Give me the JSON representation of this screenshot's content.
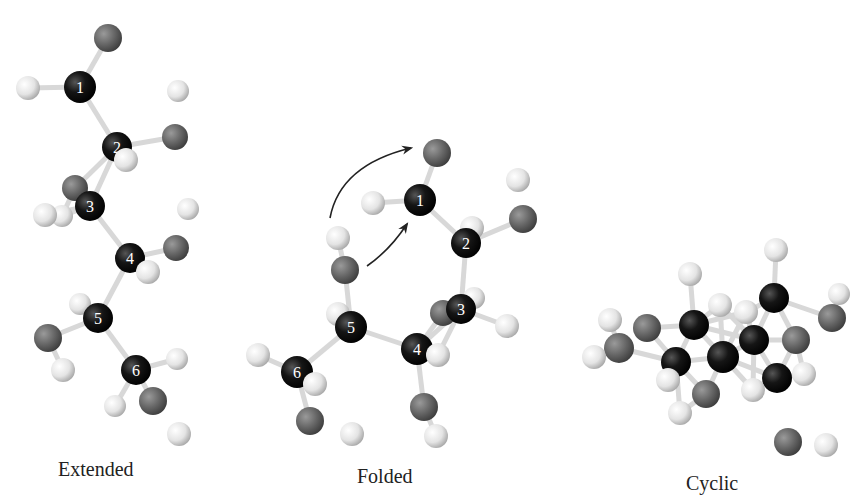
{
  "figure": {
    "panels": [
      {
        "id": "extended",
        "caption": "Extended",
        "carbon_labels": [
          "1",
          "2",
          "3",
          "4",
          "5",
          "6"
        ],
        "atoms": [
          {
            "el": "O",
            "x": 108,
            "y": 38,
            "r": 14
          },
          {
            "el": "C",
            "x": 80,
            "y": 87,
            "r": 16,
            "label": "1"
          },
          {
            "el": "H",
            "x": 28,
            "y": 88,
            "r": 12
          },
          {
            "el": "H",
            "x": 178,
            "y": 91,
            "r": 11
          },
          {
            "el": "O",
            "x": 175,
            "y": 137,
            "r": 13
          },
          {
            "el": "C",
            "x": 117,
            "y": 147,
            "r": 15,
            "label": "2"
          },
          {
            "el": "H",
            "x": 126,
            "y": 160,
            "r": 12
          },
          {
            "el": "O",
            "x": 75,
            "y": 188,
            "r": 13
          },
          {
            "el": "H",
            "x": 62,
            "y": 216,
            "r": 11
          },
          {
            "el": "H",
            "x": 45,
            "y": 215,
            "r": 12
          },
          {
            "el": "C",
            "x": 90,
            "y": 206,
            "r": 15,
            "label": "3"
          },
          {
            "el": "H",
            "x": 188,
            "y": 209,
            "r": 11
          },
          {
            "el": "O",
            "x": 176,
            "y": 248,
            "r": 13
          },
          {
            "el": "C",
            "x": 130,
            "y": 258,
            "r": 15,
            "label": "4"
          },
          {
            "el": "H",
            "x": 148,
            "y": 272,
            "r": 12
          },
          {
            "el": "H",
            "x": 80,
            "y": 304,
            "r": 11
          },
          {
            "el": "C",
            "x": 98,
            "y": 318,
            "r": 15,
            "label": "5"
          },
          {
            "el": "O",
            "x": 48,
            "y": 338,
            "r": 14
          },
          {
            "el": "H",
            "x": 63,
            "y": 370,
            "r": 12
          },
          {
            "el": "C",
            "x": 136,
            "y": 370,
            "r": 15,
            "label": "6"
          },
          {
            "el": "H",
            "x": 177,
            "y": 359,
            "r": 11
          },
          {
            "el": "H",
            "x": 115,
            "y": 406,
            "r": 11
          },
          {
            "el": "O",
            "x": 153,
            "y": 401,
            "r": 14
          },
          {
            "el": "H",
            "x": 179,
            "y": 434,
            "r": 12
          }
        ]
      },
      {
        "id": "folded",
        "caption": "Folded",
        "carbon_labels": [
          "1",
          "2",
          "3",
          "4",
          "5",
          "6"
        ],
        "atoms": [
          {
            "el": "O",
            "x": 437,
            "y": 153,
            "r": 14
          },
          {
            "el": "H",
            "x": 518,
            "y": 180,
            "r": 12
          },
          {
            "el": "H",
            "x": 373,
            "y": 203,
            "r": 12
          },
          {
            "el": "C",
            "x": 420,
            "y": 200,
            "r": 16,
            "label": "1"
          },
          {
            "el": "O",
            "x": 523,
            "y": 219,
            "r": 14
          },
          {
            "el": "H",
            "x": 472,
            "y": 228,
            "r": 12
          },
          {
            "el": "C",
            "x": 466,
            "y": 243,
            "r": 15,
            "label": "2"
          },
          {
            "el": "H",
            "x": 338,
            "y": 238,
            "r": 12
          },
          {
            "el": "O",
            "x": 345,
            "y": 270,
            "r": 14
          },
          {
            "el": "O",
            "x": 443,
            "y": 313,
            "r": 13
          },
          {
            "el": "H",
            "x": 474,
            "y": 298,
            "r": 11
          },
          {
            "el": "C",
            "x": 461,
            "y": 309,
            "r": 15,
            "label": "3"
          },
          {
            "el": "H",
            "x": 507,
            "y": 326,
            "r": 12
          },
          {
            "el": "H",
            "x": 338,
            "y": 314,
            "r": 12
          },
          {
            "el": "C",
            "x": 351,
            "y": 327,
            "r": 16,
            "label": "5"
          },
          {
            "el": "C",
            "x": 417,
            "y": 349,
            "r": 16,
            "label": "4"
          },
          {
            "el": "H",
            "x": 438,
            "y": 355,
            "r": 12
          },
          {
            "el": "H",
            "x": 258,
            "y": 355,
            "r": 12
          },
          {
            "el": "C",
            "x": 297,
            "y": 372,
            "r": 16,
            "label": "6"
          },
          {
            "el": "H",
            "x": 315,
            "y": 384,
            "r": 12
          },
          {
            "el": "O",
            "x": 424,
            "y": 407,
            "r": 14
          },
          {
            "el": "O",
            "x": 310,
            "y": 421,
            "r": 14
          },
          {
            "el": "H",
            "x": 436,
            "y": 436,
            "r": 12
          },
          {
            "el": "H",
            "x": 352,
            "y": 434,
            "r": 12
          }
        ],
        "arrows": [
          {
            "from": [
              330,
              218
            ],
            "via": [
              340,
              165
            ],
            "to": [
              411,
              148
            ]
          },
          {
            "from": [
              367,
              266
            ],
            "via": [
              390,
              250
            ],
            "to": [
              407,
              224
            ]
          }
        ]
      },
      {
        "id": "cyclic",
        "caption": "Cyclic",
        "atoms": [
          {
            "el": "H",
            "x": 776,
            "y": 250,
            "r": 12
          },
          {
            "el": "H",
            "x": 690,
            "y": 274,
            "r": 12
          },
          {
            "el": "H",
            "x": 720,
            "y": 305,
            "r": 12
          },
          {
            "el": "H",
            "x": 746,
            "y": 312,
            "r": 12
          },
          {
            "el": "C",
            "x": 774,
            "y": 298,
            "r": 15
          },
          {
            "el": "H",
            "x": 839,
            "y": 294,
            "r": 11
          },
          {
            "el": "O",
            "x": 832,
            "y": 318,
            "r": 14
          },
          {
            "el": "H",
            "x": 610,
            "y": 320,
            "r": 12
          },
          {
            "el": "O",
            "x": 647,
            "y": 328,
            "r": 14
          },
          {
            "el": "C",
            "x": 694,
            "y": 325,
            "r": 15
          },
          {
            "el": "C",
            "x": 754,
            "y": 340,
            "r": 15
          },
          {
            "el": "O",
            "x": 796,
            "y": 340,
            "r": 14
          },
          {
            "el": "O",
            "x": 619,
            "y": 348,
            "r": 15
          },
          {
            "el": "H",
            "x": 594,
            "y": 357,
            "r": 12
          },
          {
            "el": "C",
            "x": 676,
            "y": 362,
            "r": 15
          },
          {
            "el": "C",
            "x": 723,
            "y": 357,
            "r": 16
          },
          {
            "el": "C",
            "x": 777,
            "y": 378,
            "r": 15
          },
          {
            "el": "H",
            "x": 804,
            "y": 374,
            "r": 12
          },
          {
            "el": "H",
            "x": 668,
            "y": 380,
            "r": 12
          },
          {
            "el": "H",
            "x": 753,
            "y": 390,
            "r": 12
          },
          {
            "el": "O",
            "x": 706,
            "y": 394,
            "r": 14
          },
          {
            "el": "H",
            "x": 680,
            "y": 413,
            "r": 12
          },
          {
            "el": "O",
            "x": 788,
            "y": 442,
            "r": 14
          },
          {
            "el": "H",
            "x": 826,
            "y": 445,
            "r": 12
          }
        ]
      }
    ]
  },
  "colors": {
    "carbon": "#111111",
    "oxygen": "#6a6a6a",
    "hydrogen": "#e2e2e2",
    "bond": "#d8d8d8",
    "arrow": "#222222",
    "label": "#ffffff",
    "caption": "#222222"
  }
}
